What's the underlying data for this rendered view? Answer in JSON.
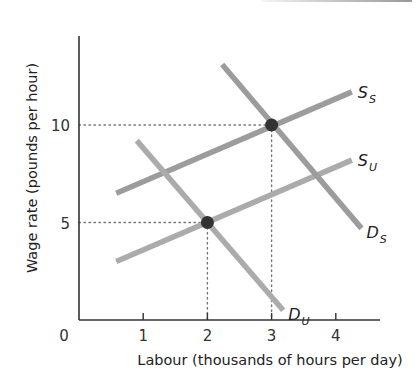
{
  "chart_data": {
    "type": "line",
    "title": "",
    "xlabel": "Labour (thousands of hours per day)",
    "ylabel": "Wage rate (pounds per hour)",
    "xlim": [
      0,
      4.7
    ],
    "ylim": [
      0,
      14.5
    ],
    "x_ticks": [
      {
        "value": 0,
        "label": "0"
      },
      {
        "value": 1,
        "label": "1"
      },
      {
        "value": 2,
        "label": "2"
      },
      {
        "value": 3,
        "label": "3"
      },
      {
        "value": 4,
        "label": "4"
      }
    ],
    "y_ticks": [
      {
        "value": 5,
        "label": "5"
      },
      {
        "value": 10,
        "label": "10"
      }
    ],
    "grid": false,
    "legend": "inline curve labels",
    "series": [
      {
        "name": "S_S",
        "label_main": "S",
        "label_sub": "S",
        "kind": "supply",
        "color": "#9c9c9c",
        "points": [
          [
            0.58,
            6.5
          ],
          [
            4.25,
            11.7
          ]
        ]
      },
      {
        "name": "S_U",
        "label_main": "S",
        "label_sub": "U",
        "kind": "supply",
        "color": "#ababab",
        "points": [
          [
            0.58,
            3.0
          ],
          [
            4.25,
            8.2
          ]
        ]
      },
      {
        "name": "D_S",
        "label_main": "D",
        "label_sub": "S",
        "kind": "demand",
        "color": "#9c9c9c",
        "points": [
          [
            2.23,
            13.1
          ],
          [
            4.4,
            4.7
          ]
        ]
      },
      {
        "name": "D_U",
        "label_main": "D",
        "label_sub": "U",
        "kind": "demand",
        "color": "#ababab",
        "points": [
          [
            0.9,
            9.2
          ],
          [
            3.18,
            0.5
          ]
        ]
      }
    ],
    "equilibria": [
      {
        "name": "skilled",
        "x": 3,
        "y": 10
      },
      {
        "name": "unskilled",
        "x": 2,
        "y": 5
      }
    ],
    "annotations": [
      {
        "type": "dotted-guide",
        "from": [
          0,
          10
        ],
        "to": [
          3,
          10
        ]
      },
      {
        "type": "dotted-guide",
        "from": [
          3,
          10
        ],
        "to": [
          3,
          0
        ]
      },
      {
        "type": "dotted-guide",
        "from": [
          0,
          5
        ],
        "to": [
          2,
          5
        ]
      },
      {
        "type": "dotted-guide",
        "from": [
          2,
          5
        ],
        "to": [
          2,
          0
        ]
      }
    ]
  },
  "colors": {
    "axis": "#333333",
    "equilibrium_dot": "#333333",
    "guide": "#777777"
  }
}
